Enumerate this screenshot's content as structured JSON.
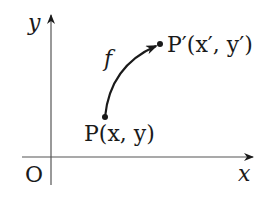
{
  "diagram": {
    "type": "coordinate-mapping",
    "axes": {
      "x_label": "x",
      "y_label": "y",
      "origin_label": "O"
    },
    "mapping": {
      "label": "f",
      "source_point": {
        "name": "P",
        "coords": "(x, y)",
        "label": "P(x, y)"
      },
      "target_point": {
        "name": "P′",
        "coords": "(x′, y′)",
        "label": "P′(x′, y′)"
      }
    },
    "colors": {
      "ink": "#1a1a1a",
      "axis": "#555555",
      "background": "#ffffff"
    }
  }
}
